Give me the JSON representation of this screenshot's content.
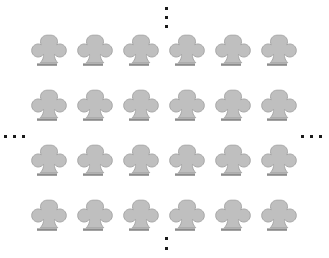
{
  "figure": {
    "symbol_name": "club-suit",
    "symbol_glyph": "♣",
    "symbol_fill_color": "#bfbfbf",
    "symbol_outline_color": "#8c8c8c",
    "symbol_shadow_color": "#a6a6a6",
    "background_color": "#ffffff",
    "ellipsis_dot_color": "#1a1a1a",
    "rows": 4,
    "columns": 6,
    "visible_symbol_count": 24,
    "grid": [
      [
        "♣",
        "♣",
        "♣",
        "♣",
        "♣",
        "♣"
      ],
      [
        "♣",
        "♣",
        "♣",
        "♣",
        "♣",
        "♣"
      ],
      [
        "♣",
        "♣",
        "♣",
        "♣",
        "♣",
        "♣"
      ],
      [
        "♣",
        "♣",
        "♣",
        "♣",
        "♣",
        "♣"
      ]
    ],
    "column_centers_x": [
      47,
      93,
      139,
      185,
      231,
      277
    ],
    "row_centers_y": [
      53,
      108,
      163,
      218
    ],
    "ellipses": [
      {
        "name": "ellipsis-top",
        "orientation": "vertical",
        "dot_count": 3,
        "x": 166,
        "y_positions": [
          8,
          17,
          26
        ],
        "meaning": "continues-upward"
      },
      {
        "name": "ellipsis-left",
        "orientation": "horizontal",
        "dot_count": 3,
        "y": 137,
        "x_positions": [
          5,
          13,
          21
        ],
        "meaning": "continues-leftward"
      },
      {
        "name": "ellipsis-right",
        "orientation": "horizontal",
        "dot_count": 3,
        "y": 137,
        "x_positions": [
          303,
          311,
          319
        ],
        "meaning": "continues-rightward"
      },
      {
        "name": "ellipsis-bottom",
        "orientation": "vertical",
        "dot_count": 2,
        "x": 166,
        "y_positions": [
          238,
          248
        ],
        "meaning": "continues-downward"
      }
    ]
  }
}
